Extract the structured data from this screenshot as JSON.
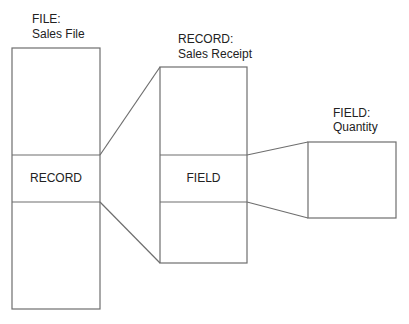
{
  "file": {
    "heading": "FILE:",
    "name": "Sales File",
    "middle_label": "RECORD"
  },
  "record": {
    "heading": "RECORD:",
    "name": "Sales Receipt",
    "middle_label": "FIELD"
  },
  "field": {
    "heading": "FIELD:",
    "name": "Quantity"
  },
  "colors": {
    "stroke": "#6e6e6e",
    "text": "#222222",
    "background": "#ffffff"
  }
}
